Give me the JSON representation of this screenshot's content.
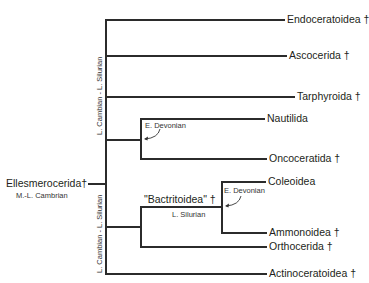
{
  "diagram": {
    "type": "phylogenetic-tree",
    "root": {
      "label": "Ellesmerocerida",
      "extinct_mark": "†",
      "age": "M.-L. Cambrian"
    },
    "branch_age_labels": {
      "upper_stem": "L. Cambian - L. Silurian",
      "lower_stem": "L. Cambian - L. Silurian",
      "nautilid_split": "E. Devonian",
      "bactritoid_stem": "L. Silurian",
      "coleoid_split": "E. Devonian"
    },
    "internal_labels": {
      "bactritoidea": "\"Bactritoidea\" †"
    },
    "taxa": [
      {
        "label": "Endoceratoidea †"
      },
      {
        "label": "Ascocerida †"
      },
      {
        "label": "Tarphyroida †"
      },
      {
        "label": "Nautilida"
      },
      {
        "label": "Oncoceratida †"
      },
      {
        "label": "Coleoidea"
      },
      {
        "label": "Ammonoidea †"
      },
      {
        "label": "Orthocerida †"
      },
      {
        "label": "Actinoceratoidea †"
      }
    ]
  }
}
